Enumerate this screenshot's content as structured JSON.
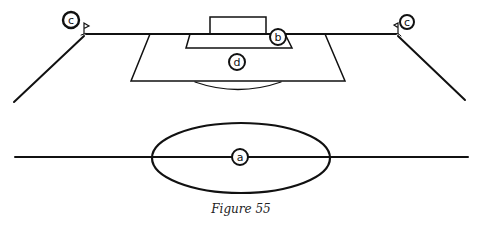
{
  "figure": {
    "caption": "Figure 55",
    "labels": [
      {
        "id": "a",
        "text": "a",
        "target": "center circle"
      },
      {
        "id": "b",
        "text": "b",
        "target": "goal area"
      },
      {
        "id": "c_left",
        "text": "c",
        "target": "left corner flag"
      },
      {
        "id": "c_right",
        "text": "c",
        "target": "right corner flag"
      },
      {
        "id": "d",
        "text": "d",
        "target": "penalty area"
      }
    ]
  }
}
